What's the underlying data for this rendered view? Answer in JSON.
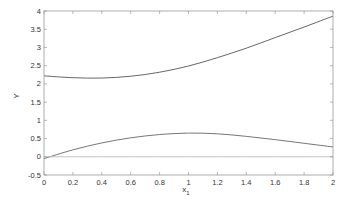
{
  "chart_data": {
    "type": "line",
    "title": "",
    "xlabel": "x",
    "xlabel_subscript": "1",
    "ylabel": "Y",
    "xlim": [
      0,
      2
    ],
    "ylim": [
      -0.5,
      4
    ],
    "grid": false,
    "legend": null,
    "xticks": [
      "0",
      "0.2",
      "0.4",
      "0.6",
      "0.8",
      "1",
      "1.2",
      "1.4",
      "1.6",
      "1.8",
      "2"
    ],
    "yticks": [
      "-0.5",
      "0",
      "0.5",
      "1",
      "1.5",
      "2",
      "2.5",
      "3",
      "3.5",
      "4"
    ],
    "x": [
      0,
      0.2,
      0.4,
      0.6,
      0.8,
      1.0,
      1.2,
      1.4,
      1.6,
      1.8,
      2.0
    ],
    "series": [
      {
        "name": "upper curve",
        "color": "#555555",
        "values": [
          2.22,
          2.17,
          2.16,
          2.21,
          2.32,
          2.49,
          2.72,
          2.98,
          3.27,
          3.56,
          3.86
        ]
      },
      {
        "name": "lower curve",
        "color": "#666666",
        "values": [
          -0.05,
          0.19,
          0.38,
          0.52,
          0.61,
          0.65,
          0.63,
          0.56,
          0.47,
          0.37,
          0.27
        ]
      },
      {
        "name": "zero line",
        "color": "#bbbbbb",
        "values": [
          0,
          0,
          0,
          0,
          0,
          0,
          0,
          0,
          0,
          0,
          0
        ]
      }
    ]
  }
}
